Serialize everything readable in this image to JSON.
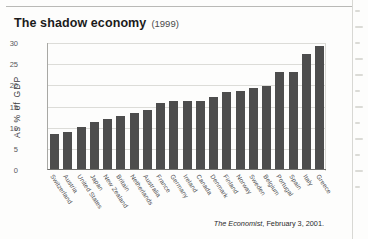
{
  "figure": {
    "title": "The shadow economy",
    "title_year": "(1999)",
    "source": "The Economist, February 3, 2001.",
    "source_publication": "The Economist",
    "source_rest": ", February 3, 2001."
  },
  "chart_data": {
    "type": "bar",
    "title": "The shadow economy (1999)",
    "xlabel": "",
    "ylabel": "As % of GDP",
    "ylim": [
      0,
      30
    ],
    "yticks": [
      0,
      5,
      10,
      15,
      20,
      25,
      30
    ],
    "grid": true,
    "legend": false,
    "bar_color": "#4d4d4d",
    "categories": [
      "Switzerland",
      "Austria",
      "United States",
      "Japan",
      "New Zealand",
      "Britain",
      "Netherlands",
      "Australia",
      "France",
      "Germany",
      "Ireland",
      "Canada",
      "Denmark",
      "Finland",
      "Norway",
      "Sweden",
      "Belgium",
      "Portugal",
      "Spain",
      "Italy",
      "Greece"
    ],
    "values": [
      8.3,
      8.8,
      9.9,
      11.2,
      11.9,
      12.5,
      13.2,
      14.0,
      15.5,
      16.0,
      16.0,
      16.0,
      17.0,
      18.2,
      18.4,
      19.2,
      19.5,
      22.8,
      22.8,
      27.1,
      29.0
    ]
  },
  "margin": {
    "ghost_lines": [
      "s",
      "m",
      "s",
      "m",
      "m",
      "s",
      "m",
      "s",
      "m",
      "s",
      "m",
      "s"
    ]
  }
}
